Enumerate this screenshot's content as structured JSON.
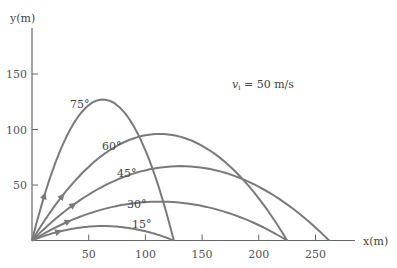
{
  "chart_data": {
    "type": "line",
    "title": "",
    "annotation": "v_i = 50 m/s",
    "annotation_parts": {
      "symbol": "v",
      "subscript": "i",
      "rest": " = 50 m/s"
    },
    "xlabel": "x(m)",
    "ylabel": "y(m)",
    "xlim": [
      0,
      290
    ],
    "ylim": [
      0,
      180
    ],
    "x_ticks": [
      50,
      100,
      150,
      200,
      250
    ],
    "y_ticks": [
      50,
      100,
      150
    ],
    "grid": false,
    "legend": "inline labels",
    "initial_speed_m_s": 50,
    "series": [
      {
        "name": "75°",
        "angle_deg": 75,
        "range_m": 125,
        "max_height_m": 127
      },
      {
        "name": "60°",
        "angle_deg": 60,
        "range_m": 225,
        "max_height_m": 96
      },
      {
        "name": "45°",
        "angle_deg": 45,
        "range_m": 262,
        "max_height_m": 67
      },
      {
        "name": "30°",
        "angle_deg": 30,
        "range_m": 225,
        "max_height_m": 35
      },
      {
        "name": "15°",
        "angle_deg": 15,
        "range_m": 125,
        "max_height_m": 13
      }
    ],
    "colors": {
      "curve": "#7a7a7a",
      "axis": "#666666",
      "text": "#444444"
    }
  }
}
